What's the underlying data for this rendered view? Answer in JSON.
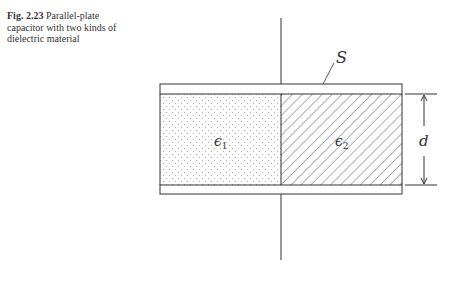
{
  "figure": {
    "caption_label": "Fig. 2.23",
    "caption_text": "Parallel-plate capacitor with two kinds of dielectric material"
  },
  "diagram": {
    "surface_label": "S",
    "dielectric_1_label": "ϵ",
    "dielectric_1_sub": "1",
    "dielectric_2_label": "ϵ",
    "dielectric_2_sub": "2",
    "gap_label": "d",
    "colors": {
      "line": "#333333",
      "dots": "#888888",
      "hatch": "#333333"
    }
  }
}
